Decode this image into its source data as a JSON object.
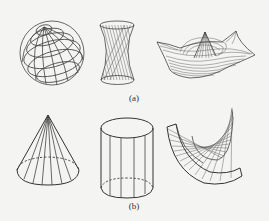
{
  "figure": {
    "background": "#f4f4f2",
    "line_color": "#444444",
    "panels": [
      {
        "label": "(a)",
        "shapes": [
          {
            "name": "sphere",
            "description": "wireframe sphere with latitude/longitude grid"
          },
          {
            "name": "hyperboloid",
            "description": "hyperboloid of one sheet with ruled lines"
          },
          {
            "name": "wavy-surface",
            "description": "3D surface plot with central peak and raised corners"
          }
        ]
      },
      {
        "label": "(b)",
        "shapes": [
          {
            "name": "cone",
            "description": "cone with generator lines and dashed hidden base"
          },
          {
            "name": "cylinder",
            "description": "cylinder with generator lines and dashed hidden base"
          },
          {
            "name": "developable-surface",
            "description": "helical ruled developable surface"
          }
        ]
      }
    ]
  }
}
